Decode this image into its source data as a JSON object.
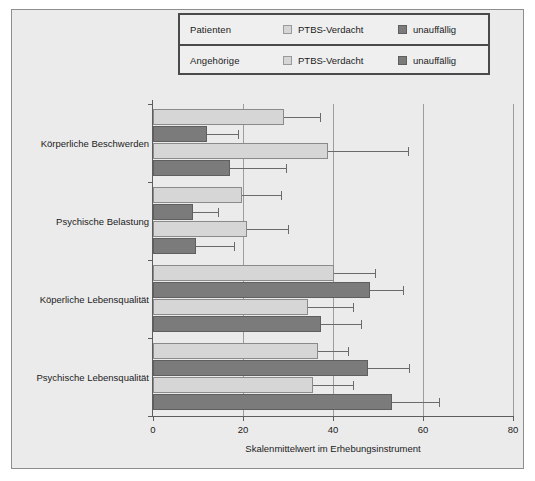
{
  "legend": {
    "rows": [
      {
        "group_label": "Patienten",
        "entries": [
          {
            "label": "PTBS-Verdacht",
            "color": "#d6d6d6",
            "swatch_name": "legend-swatch-patienten-ptbs"
          },
          {
            "label": "unauffällig",
            "color": "#7b7b7b",
            "swatch_name": "legend-swatch-patienten-unauffaellig"
          }
        ]
      },
      {
        "group_label": "Angehörige",
        "entries": [
          {
            "label": "PTBS-Verdacht",
            "color": "#d6d6d6",
            "swatch_name": "legend-swatch-angehoerige-ptbs"
          },
          {
            "label": "unauffällig",
            "color": "#7b7b7b",
            "swatch_name": "legend-swatch-angehoerige-unauffaellig"
          }
        ]
      }
    ]
  },
  "chart_data": {
    "type": "bar",
    "orientation": "horizontal",
    "title": "",
    "xlabel": "Skalenmittelwert im Erhebungsinstrument",
    "ylabel": "",
    "xlim": [
      0,
      80
    ],
    "xticks": [
      0,
      20,
      40,
      60,
      80
    ],
    "xtick_labels": [
      "0",
      "20",
      "40",
      "60",
      "80"
    ],
    "grid": "vertical",
    "legend_position": "top",
    "error_bars": "horizontal-whisker",
    "categories": [
      "Körperliche Beschwerden",
      "Psychische Belastung",
      "Köperliche Lebensqualität",
      "Psychische Lebensqualität"
    ],
    "series": [
      {
        "name": "Patienten PTBS-Verdacht",
        "color": "#d6d6d6",
        "values": [
          29.0,
          19.8,
          40.3,
          36.6
        ],
        "errors": [
          8.0,
          8.6,
          9.0,
          6.7
        ]
      },
      {
        "name": "Patienten unauffällig",
        "color": "#7b7b7b",
        "values": [
          12.0,
          8.8,
          48.2,
          47.8
        ],
        "errors": [
          6.9,
          5.6,
          7.4,
          9.0
        ]
      },
      {
        "name": "Angehörige PTBS-Verdacht",
        "color": "#d6d6d6",
        "values": [
          38.8,
          20.8,
          34.5,
          35.5
        ],
        "errors": [
          17.8,
          9.1,
          9.9,
          9.0
        ]
      },
      {
        "name": "Angehörige unauffällig",
        "color": "#7b7b7b",
        "values": [
          17.0,
          9.5,
          37.4,
          53.0
        ],
        "errors": [
          12.5,
          8.4,
          8.9,
          10.5
        ]
      }
    ]
  }
}
